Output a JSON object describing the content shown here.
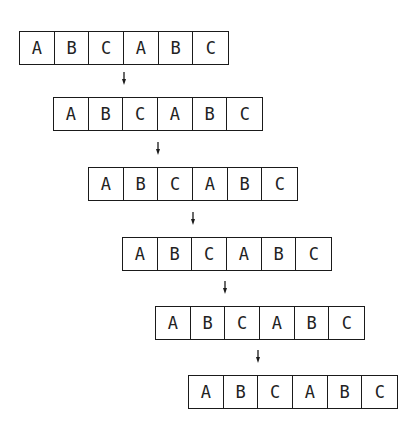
{
  "diagram": {
    "rows": [
      {
        "cells": [
          "A",
          "B",
          "C",
          "A",
          "B",
          "C"
        ],
        "x": 19,
        "y": 31
      },
      {
        "cells": [
          "A",
          "B",
          "C",
          "A",
          "B",
          "C"
        ],
        "x": 53,
        "y": 97
      },
      {
        "cells": [
          "A",
          "B",
          "C",
          "A",
          "B",
          "C"
        ],
        "x": 88,
        "y": 167
      },
      {
        "cells": [
          "A",
          "B",
          "C",
          "A",
          "B",
          "C"
        ],
        "x": 122,
        "y": 237
      },
      {
        "cells": [
          "A",
          "B",
          "C",
          "A",
          "B",
          "C"
        ],
        "x": 155,
        "y": 306
      },
      {
        "cells": [
          "A",
          "B",
          "C",
          "A",
          "B",
          "C"
        ],
        "x": 188,
        "y": 375
      }
    ],
    "arrows": [
      {
        "x": 124,
        "y": 72
      },
      {
        "x": 158,
        "y": 142
      },
      {
        "x": 193,
        "y": 212
      },
      {
        "x": 225,
        "y": 281
      },
      {
        "x": 258,
        "y": 350
      }
    ],
    "colors": {
      "stroke": "#1a1a1a",
      "background": "#ffffff"
    }
  }
}
